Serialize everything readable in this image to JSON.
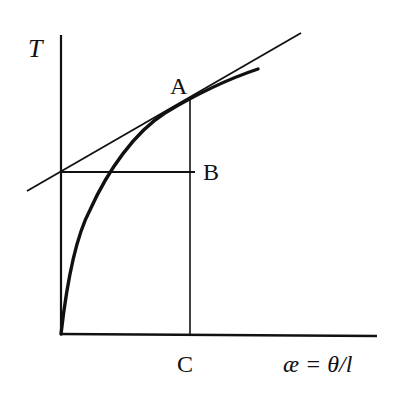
{
  "diagram": {
    "y_axis_label": "T",
    "x_axis_label": "æ = θ/l",
    "points": {
      "A": "A",
      "B": "B",
      "C": "C"
    },
    "elements": [
      "y-axis",
      "x-axis",
      "curve from origin rising and flattening (concave down)",
      "tangent line touching curve at A, intercepting T-axis at level of B",
      "vertical line from A down to C on x-axis",
      "horizontal line from T-axis intercept to B"
    ],
    "colors": {
      "ink": "#111111",
      "background": "#ffffff"
    }
  }
}
